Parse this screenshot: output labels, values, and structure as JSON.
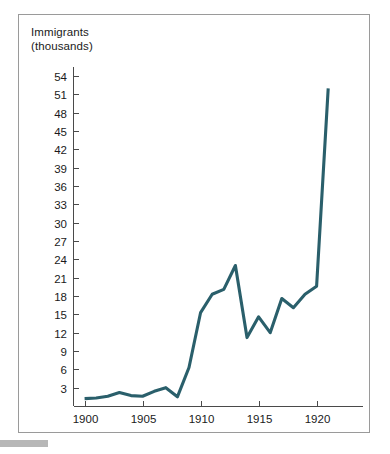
{
  "figure": {
    "y_axis_title": "Immigrants\n(thousands)",
    "border_color": "#9a9a9a",
    "line_color": "#2a5f6b",
    "footer_bar_color": "#b7b7b7"
  },
  "chart_data": {
    "type": "line",
    "title": "",
    "subtitle": "",
    "xlabel": "",
    "ylabel": "Immigrants (thousands)",
    "xlim": [
      1899,
      1924
    ],
    "ylim": [
      0,
      55.5
    ],
    "grid": false,
    "legend": null,
    "y_ticks": [
      3,
      6,
      9,
      12,
      15,
      18,
      21,
      24,
      27,
      30,
      33,
      36,
      39,
      42,
      45,
      48,
      51,
      54
    ],
    "y_tick_labels": [
      "3",
      "6",
      "9",
      "12",
      "15",
      "18",
      "21",
      "24",
      "27",
      "30",
      "33",
      "36",
      "39",
      "42",
      "45",
      "48",
      "51",
      "54"
    ],
    "x_ticks": [
      1900,
      1905,
      1910,
      1915,
      1920
    ],
    "x_tick_labels": [
      "1900",
      "1905",
      "1910",
      "1915",
      "1920"
    ],
    "x_minor_ticks": [
      1900,
      1905,
      1910,
      1915,
      1920
    ],
    "series": [
      {
        "name": "Immigrants",
        "color": "#2a5f6b",
        "x": [
          1900,
          1901,
          1902,
          1903,
          1904,
          1905,
          1906,
          1907,
          1908,
          1909,
          1910,
          1911,
          1912,
          1913,
          1914,
          1915,
          1916,
          1917,
          1918,
          1919,
          1920,
          1921
        ],
        "values": [
          1.2,
          1.3,
          1.6,
          2.2,
          1.7,
          1.6,
          2.4,
          3.0,
          1.5,
          6.3,
          15.3,
          18.3,
          19.1,
          23.0,
          11.2,
          14.6,
          12.0,
          17.6,
          16.1,
          18.3,
          19.6,
          52.0
        ]
      }
    ]
  }
}
